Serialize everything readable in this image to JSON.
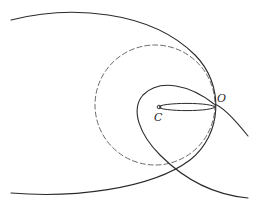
{
  "figure": {
    "width": 262,
    "height": 218,
    "background": "#ffffff",
    "stroke_color": "#2a2a2a",
    "dashed_color": "#6a6a6a",
    "labels": {
      "center": "C",
      "origin": "O"
    },
    "points": {
      "C": {
        "x": 159,
        "y": 107
      },
      "O": {
        "x": 214,
        "y": 104
      }
    },
    "curves": {
      "outer_ellipse_arc": "M11,20 C70,5 150,10 195,55 C225,85 222,135 190,160 C150,190 70,198 11,193",
      "dashed_circle": {
        "cx": 155,
        "cy": 105,
        "r": 60
      },
      "inner_loop": "M248,136 C232,116 222,106 214,104 C190,85 160,78 143,95 C130,110 140,135 160,155 C185,180 215,195 248,198",
      "thin_ellipse": {
        "cx": 187,
        "cy": 107,
        "rx": 28,
        "ry": 3.6
      }
    }
  }
}
